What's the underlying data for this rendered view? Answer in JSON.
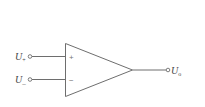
{
  "diagram": {
    "type": "op-amp-symbol",
    "colors": {
      "stroke": "#6e6e6e",
      "text": "#444444",
      "background": "#ffffff"
    },
    "inputs": [
      {
        "id": "non-inverting",
        "label_main": "U",
        "label_sub": "+",
        "sign": "+"
      },
      {
        "id": "inverting",
        "label_main": "U",
        "label_sub": "_",
        "sign": "−"
      }
    ],
    "output": {
      "label_main": "U",
      "label_sub": "o"
    }
  }
}
